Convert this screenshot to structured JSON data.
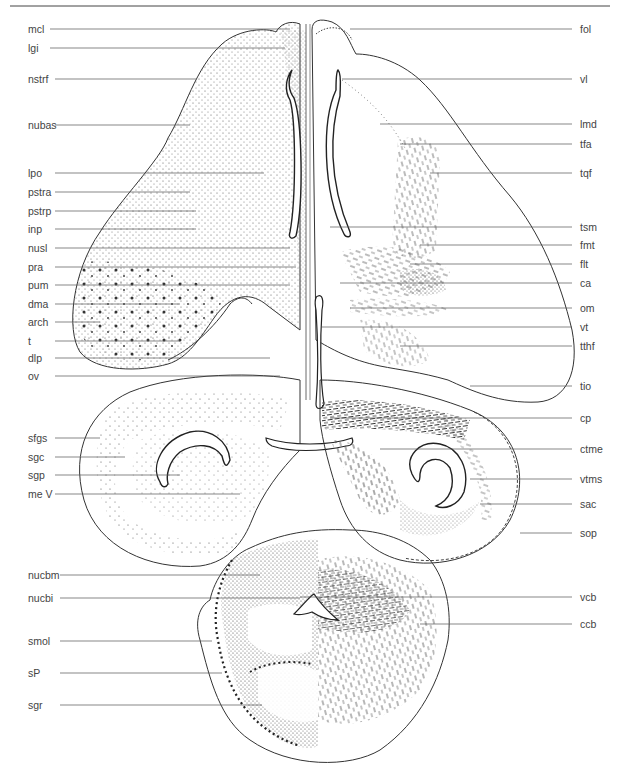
{
  "figure": {
    "type": "anatomical atlas plate (transverse section, brain)",
    "header_text_visible": false,
    "colors": {
      "ink": "#333333",
      "leader": "#555555",
      "background": "#ffffff",
      "stipple": "#444444"
    }
  },
  "labels": {
    "left": [
      {
        "text": "mcl",
        "y": 29
      },
      {
        "text": "lgi",
        "y": 48
      },
      {
        "text": "nstrf",
        "y": 79
      },
      {
        "text": "nubas",
        "y": 125
      },
      {
        "text": "lpo",
        "y": 173
      },
      {
        "text": "pstra",
        "y": 192
      },
      {
        "text": "pstrp",
        "y": 211
      },
      {
        "text": "inp",
        "y": 229
      },
      {
        "text": "nusl",
        "y": 248
      },
      {
        "text": "pra",
        "y": 267
      },
      {
        "text": "pum",
        "y": 285
      },
      {
        "text": "dma",
        "y": 304
      },
      {
        "text": "arch",
        "y": 322
      },
      {
        "text": "t",
        "y": 341
      },
      {
        "text": "dlp",
        "y": 358
      },
      {
        "text": "ov",
        "y": 376
      },
      {
        "text": "sfgs",
        "y": 438
      },
      {
        "text": "sgc",
        "y": 457
      },
      {
        "text": "sgp",
        "y": 475
      },
      {
        "text": "me V",
        "y": 494
      },
      {
        "text": "nucbm",
        "y": 575
      },
      {
        "text": "nucbi",
        "y": 598
      },
      {
        "text": "smol",
        "y": 641
      },
      {
        "text": "sP",
        "y": 673
      },
      {
        "text": "sgr",
        "y": 705
      }
    ],
    "right": [
      {
        "text": "fol",
        "y": 29
      },
      {
        "text": "vl",
        "y": 79
      },
      {
        "text": "lmd",
        "y": 124
      },
      {
        "text": "tfa",
        "y": 144
      },
      {
        "text": "tqf",
        "y": 173
      },
      {
        "text": "tsm",
        "y": 227
      },
      {
        "text": "fmt",
        "y": 245
      },
      {
        "text": "flt",
        "y": 264
      },
      {
        "text": "ca",
        "y": 283
      },
      {
        "text": "om",
        "y": 308
      },
      {
        "text": "vt",
        "y": 327
      },
      {
        "text": "tthf",
        "y": 346
      },
      {
        "text": "tio",
        "y": 386
      },
      {
        "text": "cp",
        "y": 418
      },
      {
        "text": "ctme",
        "y": 449
      },
      {
        "text": "vtms",
        "y": 479
      },
      {
        "text": "sac",
        "y": 504
      },
      {
        "text": "sop",
        "y": 533
      },
      {
        "text": "vcb",
        "y": 597
      },
      {
        "text": "ccb",
        "y": 624
      }
    ]
  }
}
